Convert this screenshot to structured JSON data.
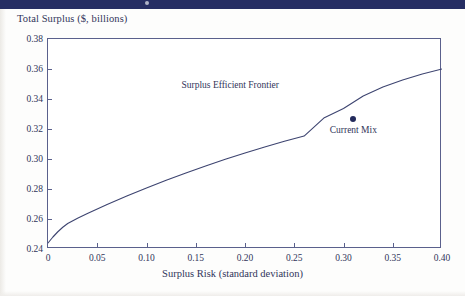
{
  "banner": {
    "name": "top-banner",
    "color": "#262e63"
  },
  "chart_data": {
    "type": "line",
    "title": "",
    "ylabel": "Total Surplus ($, billions)",
    "xlabel": "Surplus Risk (standard deviation)",
    "xlim": [
      0,
      0.4
    ],
    "ylim": [
      0.24,
      0.38
    ],
    "grid": false,
    "legend": "none",
    "xticks": [
      "0",
      "0.05",
      "0.10",
      "0.15",
      "0.20",
      "0.25",
      "0.30",
      "0.35",
      "0.40"
    ],
    "xtick_values": [
      0,
      0.05,
      0.1,
      0.15,
      0.2,
      0.25,
      0.3,
      0.35,
      0.4
    ],
    "yticks": [
      "0.24",
      "0.26",
      "0.28",
      "0.30",
      "0.32",
      "0.34",
      "0.36",
      "0.38"
    ],
    "ytick_values": [
      0.24,
      0.26,
      0.28,
      0.3,
      0.32,
      0.34,
      0.36,
      0.38
    ],
    "series": [
      {
        "name": "Surplus Efficient Frontier",
        "type": "line",
        "color": "#3d4470",
        "x": [
          0.0,
          0.005,
          0.01,
          0.015,
          0.02,
          0.03,
          0.04,
          0.06,
          0.08,
          0.1,
          0.12,
          0.14,
          0.16,
          0.18,
          0.2,
          0.22,
          0.24,
          0.26,
          0.28,
          0.3,
          0.32,
          0.34,
          0.36,
          0.38,
          0.4
        ],
        "y": [
          0.244,
          0.248,
          0.2515,
          0.2545,
          0.257,
          0.2605,
          0.2637,
          0.2697,
          0.2753,
          0.2807,
          0.2858,
          0.2907,
          0.2953,
          0.2998,
          0.304,
          0.308,
          0.3118,
          0.3153,
          0.3273,
          0.3337,
          0.342,
          0.348,
          0.3527,
          0.3567,
          0.36
        ]
      }
    ],
    "points": [
      {
        "name": "Current Mix",
        "x": 0.31,
        "y": 0.3267,
        "color": "#232a5c",
        "label": "Current Mix",
        "label_position": "below"
      }
    ],
    "annotations": [
      {
        "name": "Surplus Efficient Frontier",
        "text": "Surplus Efficient Frontier",
        "x": 0.185,
        "y": 0.3487
      }
    ]
  }
}
